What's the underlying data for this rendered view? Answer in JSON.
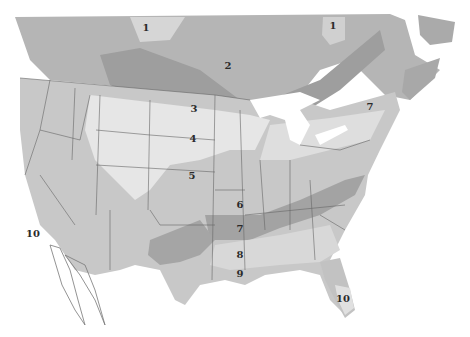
{
  "map": {
    "type": "hardiness-zone-map",
    "region": "North America (USA & southern Canada)",
    "colors": {
      "background": "#ffffff",
      "land_base": "#c9c9c9",
      "zone_dark": "#9a9a9a",
      "zone_mid": "#b3b3b3",
      "zone_light": "#dcdcdc",
      "zone_lightest": "#efefef",
      "borders": "#555555"
    },
    "zone_labels": [
      {
        "id": "z1a",
        "text": "1",
        "x": 146,
        "y": 27
      },
      {
        "id": "z1b",
        "text": "1",
        "x": 333,
        "y": 25
      },
      {
        "id": "z2",
        "text": "2",
        "x": 228,
        "y": 65
      },
      {
        "id": "z3",
        "text": "3",
        "x": 194,
        "y": 108
      },
      {
        "id": "z4",
        "text": "4",
        "x": 193,
        "y": 138
      },
      {
        "id": "z5",
        "text": "5",
        "x": 192,
        "y": 175
      },
      {
        "id": "z6",
        "text": "6",
        "x": 240,
        "y": 204
      },
      {
        "id": "z7a",
        "text": "7",
        "x": 240,
        "y": 228
      },
      {
        "id": "z7b",
        "text": "7",
        "x": 370,
        "y": 106
      },
      {
        "id": "z8",
        "text": "8",
        "x": 240,
        "y": 254
      },
      {
        "id": "z9",
        "text": "9",
        "x": 240,
        "y": 273
      },
      {
        "id": "z10a",
        "text": "10",
        "x": 33,
        "y": 233
      },
      {
        "id": "z10b",
        "text": "10",
        "x": 343,
        "y": 298
      }
    ]
  }
}
